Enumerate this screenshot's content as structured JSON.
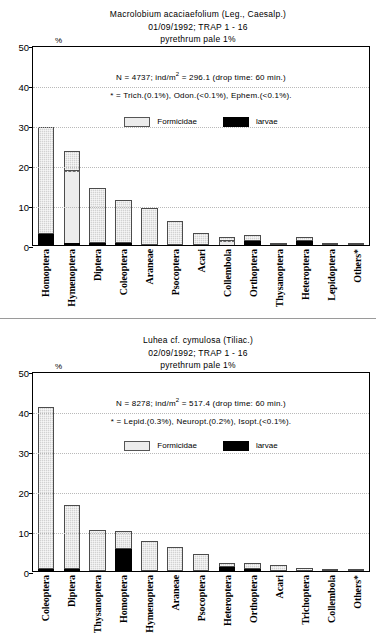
{
  "figure": {
    "y_axis_unit": "%",
    "legend": [
      {
        "key": "formicidae",
        "label": "Formicidae",
        "color": "#ececec"
      },
      {
        "key": "larvae",
        "label": "larvae",
        "color": "#000000"
      }
    ]
  },
  "panels": [
    {
      "id": "panel-1",
      "title_lines": [
        "Macrolobium acaciaefolium (Leg., Caesalp.)",
        "01/09/1992; TRAP 1 - 16",
        "pyrethrum pale 1%"
      ],
      "annotation_1_pre": "N = 4737; ind/m",
      "annotation_1_sup": "2",
      "annotation_1_post": " = 296.1 (drop time: 60 min.)",
      "annotation_2": "* = Trich.(0.1%), Odon.(<0.1%), Ephem.(<0.1%).",
      "chart_data": {
        "type": "bar",
        "title": "Macrolobium acaciaefolium (Leg., Caesalp.)",
        "subtitle": "01/09/1992; TRAP 1 - 16 / pyrethrum pale 1%",
        "xlabel": "",
        "ylabel": "%",
        "ylim": [
          0,
          50
        ],
        "yticks": [
          0,
          10,
          20,
          30,
          40,
          50
        ],
        "grid": true,
        "legend_position": "upper-center",
        "categories": [
          "Homoptera",
          "Hymenoptera",
          "Diptera",
          "Coleoptera",
          "Araneae",
          "Psocoptera",
          "Acari",
          "Collembola",
          "Orthoptera",
          "Thysanoptera",
          "Heteroptera",
          "Lepidoptera",
          "Others*"
        ],
        "series": [
          {
            "name": "other",
            "values": [
              26.9,
              4.8,
              13.6,
              10.7,
              9.1,
              6.0,
              3.0,
              1.1,
              1.4,
              0.4,
              1.0,
              0.5,
              0.3
            ]
          },
          {
            "name": "Formicidae",
            "values": [
              0.0,
              18.0,
              0.0,
              0.0,
              0.0,
              0.0,
              0.0,
              0.9,
              0.0,
              0.0,
              0.0,
              0.0,
              0.0
            ]
          },
          {
            "name": "larvae",
            "values": [
              2.6,
              0.1,
              0.4,
              0.4,
              0.0,
              0.0,
              0.0,
              0.0,
              0.9,
              0.0,
              0.8,
              0.0,
              0.0
            ]
          }
        ],
        "totals": [
          29.5,
          22.9,
          14.0,
          11.1,
          9.1,
          6.0,
          3.0,
          2.0,
          2.3,
          0.4,
          1.8,
          0.5,
          0.3
        ]
      }
    },
    {
      "id": "panel-2",
      "title_lines": [
        "Luhea cf. cymulosa (Tiliac.)",
        "02/09/1992; TRAP 1 - 16",
        "pyrethrum pale 1%"
      ],
      "annotation_1_pre": "N = 8278; ind/m",
      "annotation_1_sup": "2",
      "annotation_1_post": " = 517.4 (drop time: 60 min.)",
      "annotation_2": "* = Lepid.(0.3%), Neuropt.(0.2%), Isopt.(<0.1%).",
      "chart_data": {
        "type": "bar",
        "title": "Luhea cf. cymulosa (Tiliac.)",
        "subtitle": "02/09/1992; TRAP 1 - 16 / pyrethrum pale 1%",
        "xlabel": "",
        "ylabel": "%",
        "ylim": [
          0,
          50
        ],
        "yticks": [
          0,
          10,
          20,
          30,
          40,
          50
        ],
        "grid": true,
        "legend_position": "upper-center",
        "categories": [
          "Coleoptera",
          "Diptera",
          "Thysanoptera",
          "Homoptera",
          "Hymenoptera",
          "Araneae",
          "Psocoptera",
          "Heteroptera",
          "Orthoptera",
          "Acari",
          "Trichoptera",
          "Collembola",
          "Others*"
        ],
        "series": [
          {
            "name": "other",
            "values": [
              40.4,
              15.8,
              10.2,
              4.5,
              7.3,
              5.9,
              4.2,
              1.0,
              1.5,
              1.4,
              0.7,
              0.5,
              0.5
            ]
          },
          {
            "name": "Formicidae",
            "values": [
              0.0,
              0.0,
              0.0,
              0.0,
              0.0,
              0.0,
              0.0,
              0.0,
              0.0,
              0.0,
              0.0,
              0.0,
              0.0
            ]
          },
          {
            "name": "larvae",
            "values": [
              0.3,
              0.5,
              0.0,
              5.5,
              0.0,
              0.0,
              0.0,
              1.0,
              0.5,
              0.0,
              0.0,
              0.0,
              0.0
            ]
          }
        ],
        "totals": [
          40.7,
          16.3,
          10.2,
          10.0,
          7.3,
          5.9,
          4.2,
          2.0,
          2.0,
          1.4,
          0.7,
          0.5,
          0.5
        ]
      }
    }
  ]
}
